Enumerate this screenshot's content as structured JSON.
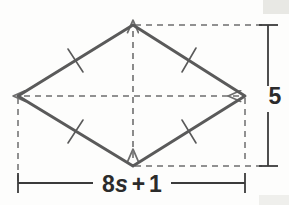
{
  "figure": {
    "type": "rhombus-with-diagonals",
    "title": "",
    "shape_name": "rhombus",
    "stroke_color": "#5a5a5a",
    "dash_color": "#6e6e6e",
    "text_color": "#2b2b2b",
    "background_color": "#fdfdfc",
    "vertices": {
      "top": {
        "x": 133,
        "y": 25
      },
      "left": {
        "x": 18,
        "y": 96
      },
      "right": {
        "x": 245,
        "y": 96
      },
      "bottom": {
        "x": 133,
        "y": 166
      }
    },
    "tick_marks": {
      "count": 4,
      "marks_per_side": 1,
      "meaning": "congruent-sides"
    },
    "diagonals": {
      "horizontal": {
        "style": "dashed",
        "arrows": "both-ends"
      },
      "vertical": {
        "style": "dashed",
        "arrows": "both-ends"
      }
    },
    "extension_lines": {
      "style": "dashed",
      "top_right": true,
      "bottom_right": true,
      "left_down": true
    },
    "dimensions": [
      {
        "name": "height",
        "label": "5",
        "orientation": "vertical",
        "position": "right",
        "label_x": 275,
        "label_y": 103,
        "line_x": 268,
        "from_y": 25,
        "to_y": 166
      },
      {
        "name": "width",
        "label_parts": {
          "coefficient": "8",
          "variable": "s",
          "operator": "+",
          "constant": "1"
        },
        "label": "8s + 1",
        "orientation": "horizontal",
        "position": "bottom",
        "label_x": 131,
        "label_y": 190,
        "line_y": 183,
        "from_x": 18,
        "to_x": 245
      }
    ]
  }
}
